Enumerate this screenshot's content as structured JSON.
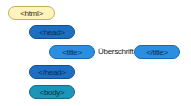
{
  "diagram": {
    "nodes": [
      {
        "id": "html",
        "label": "<html>"
      },
      {
        "id": "head_open",
        "label": "<head>"
      },
      {
        "id": "title_open",
        "label": "<title>"
      },
      {
        "id": "title_text",
        "label": "Überschrift"
      },
      {
        "id": "title_close",
        "label": "</title>"
      },
      {
        "id": "head_close",
        "label": "</head>"
      },
      {
        "id": "body_open",
        "label": "<body>"
      }
    ],
    "colors": {
      "html": "#fdf3bd",
      "head": "#1d6fc2",
      "title": "#2b8ede",
      "body": "#1b95b9"
    }
  }
}
